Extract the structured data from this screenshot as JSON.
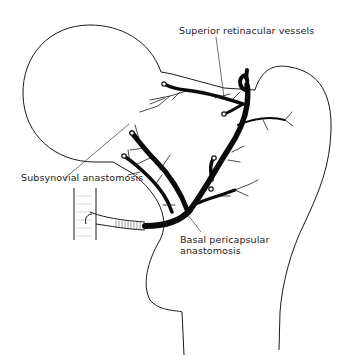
{
  "figure": {
    "type": "anatomical line drawing"
  },
  "labels": {
    "superior_retinacular": "Superior retinacular vessels",
    "subsynovial": "Subsynovial anastomosis",
    "basal_line1": "Basal pericapsular",
    "basal_line2": "anastomosis"
  },
  "colors": {
    "line": "#1a1a1a",
    "vessel": "#0a0a0a",
    "background": "#ffffff"
  }
}
